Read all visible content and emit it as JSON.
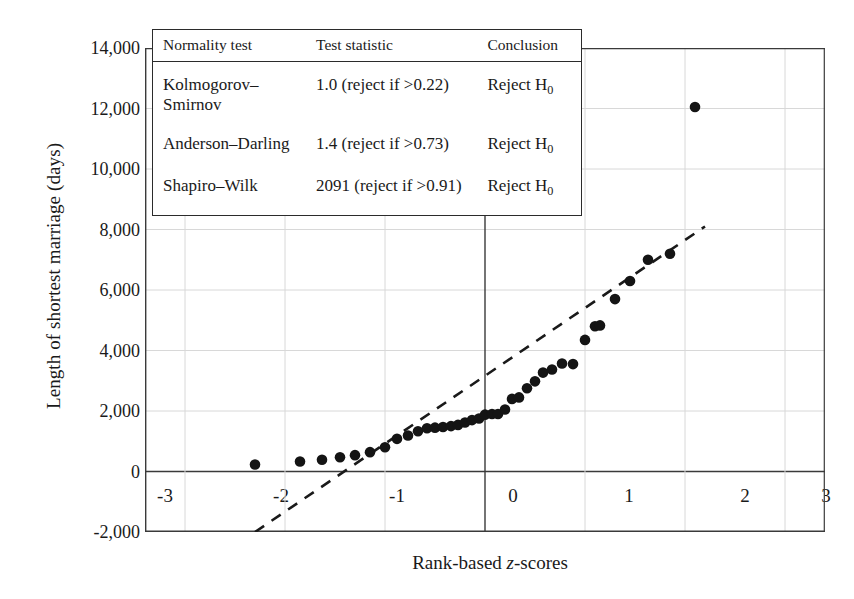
{
  "chart_data": {
    "type": "scatter",
    "title": "",
    "xlabel": "Rank-based z-scores",
    "ylabel": "Length of shortest marriage (days)",
    "xlim": [
      -3.4,
      3.4
    ],
    "ylim": [
      -2000,
      14000
    ],
    "xticks": [
      "-3",
      "-2",
      "-1",
      "0",
      "1",
      "2",
      "3"
    ],
    "xtick_values": [
      -3,
      -2,
      -1,
      0,
      1,
      2,
      3
    ],
    "yticks": [
      "-2,000",
      "0",
      "2,000",
      "4,000",
      "6,000",
      "8,000",
      "10,000",
      "12,000",
      "14,000"
    ],
    "ytick_values": [
      -2000,
      0,
      2000,
      4000,
      6000,
      8000,
      10000,
      12000,
      14000
    ],
    "grid": true,
    "legend": "none",
    "marker": "filled-circle",
    "series": [
      {
        "name": "Shortest marriage length vs rank-based z-score",
        "points": [
          [
            -2.3,
            230
          ],
          [
            -1.85,
            330
          ],
          [
            -1.63,
            390
          ],
          [
            -1.45,
            470
          ],
          [
            -1.3,
            540
          ],
          [
            -1.15,
            640
          ],
          [
            -1.0,
            800
          ],
          [
            -0.88,
            1080
          ],
          [
            -0.77,
            1190
          ],
          [
            -0.67,
            1330
          ],
          [
            -0.58,
            1430
          ],
          [
            -0.5,
            1450
          ],
          [
            -0.42,
            1470
          ],
          [
            -0.34,
            1500
          ],
          [
            -0.27,
            1540
          ],
          [
            -0.2,
            1620
          ],
          [
            -0.13,
            1700
          ],
          [
            -0.06,
            1750
          ],
          [
            0.0,
            1880
          ],
          [
            0.07,
            1900
          ],
          [
            0.13,
            1900
          ],
          [
            0.2,
            2050
          ],
          [
            0.27,
            2400
          ],
          [
            0.34,
            2450
          ],
          [
            0.42,
            2750
          ],
          [
            0.5,
            2980
          ],
          [
            0.58,
            3270
          ],
          [
            0.67,
            3370
          ],
          [
            0.77,
            3570
          ],
          [
            0.88,
            3550
          ],
          [
            1.0,
            4350
          ],
          [
            1.1,
            4800
          ],
          [
            1.15,
            4830
          ],
          [
            1.3,
            5700
          ],
          [
            1.45,
            6300
          ],
          [
            1.63,
            7000
          ],
          [
            1.85,
            7200
          ],
          [
            2.1,
            12050
          ]
        ]
      }
    ],
    "reference_line": {
      "name": "normal reference line",
      "style": "dashed",
      "x": [
        -2.3,
        2.2
      ],
      "y": [
        -2000,
        8100
      ]
    }
  },
  "stats_table": {
    "headers": [
      "Normality test",
      "Test statistic",
      "Conclusion"
    ],
    "rows": [
      {
        "test": "Kolmogorov–Smirnov",
        "statistic": "1.0 (reject if >0.22)",
        "conclusion": "Reject H",
        "conclusion_sub": "0"
      },
      {
        "test": "Anderson–Darling",
        "statistic": "1.4 (reject if >0.73)",
        "conclusion": "Reject H",
        "conclusion_sub": "0"
      },
      {
        "test": "Shapiro–Wilk",
        "statistic": "2091 (reject if >0.91)",
        "conclusion": "Reject H",
        "conclusion_sub": "0"
      }
    ]
  },
  "style": {
    "marker_color": "#141414",
    "axis_color": "#3a3a3a",
    "grid_color": "#d8d8d8",
    "reference_line_color": "#1a1a1a",
    "background": "#ffffff"
  }
}
